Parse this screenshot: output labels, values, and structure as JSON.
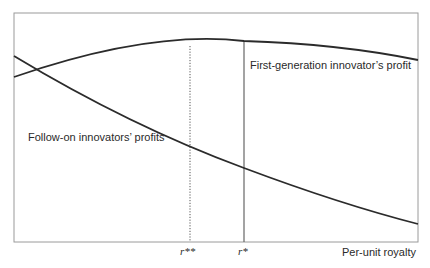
{
  "diagram": {
    "x_axis_label": "Per-unit royalty",
    "ticks": {
      "r_double_star": "r**",
      "r_star": "r*"
    },
    "curves": {
      "first_generation": {
        "label": "First-generation innovator’s profit",
        "shape": "concave, peaks at r*",
        "color": "#2b2b2b"
      },
      "follow_on": {
        "label": "Follow-on innovators’ profits",
        "shape": "decreasing, convex",
        "color": "#2b2b2b"
      }
    },
    "reference_lines": [
      {
        "at": "r**",
        "style": "dotted"
      },
      {
        "at": "r*",
        "style": "solid"
      }
    ],
    "colors": {
      "frame": "#9a9a9a",
      "curve": "#2b2b2b",
      "ref_line": "#555555"
    }
  }
}
